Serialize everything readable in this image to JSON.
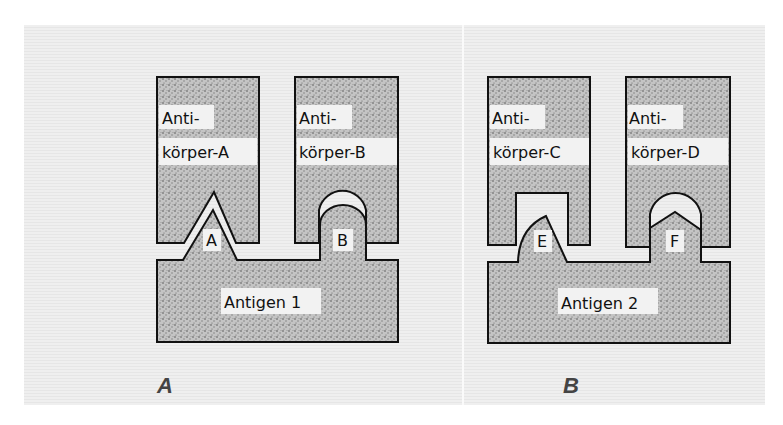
{
  "colors": {
    "page": "#ffffff",
    "panel_bg": "#efefef",
    "stipple_fill": "#bdbdbd",
    "outline": "#111111",
    "label_chip": "#f2f2f2",
    "panel_letter": "#444444"
  },
  "panels": [
    {
      "letter": "A",
      "antibodies": [
        {
          "line1": "Anti-",
          "line2": "körper-A",
          "binding_site": "triangular-notch"
        },
        {
          "line1": "Anti-",
          "line2": "körper-B",
          "binding_site": "rounded-dome"
        }
      ],
      "antigen": {
        "label": "Antigen 1",
        "epitopes": [
          {
            "label": "A",
            "shape": "triangle"
          },
          {
            "label": "B",
            "shape": "rounded-dome"
          }
        ]
      }
    },
    {
      "letter": "B",
      "antibodies": [
        {
          "line1": "Anti-",
          "line2": "körper-C",
          "binding_site": "rectangular-notch"
        },
        {
          "line1": "Anti-",
          "line2": "körper-D",
          "binding_site": "rounded-dome"
        }
      ],
      "antigen": {
        "label": "Antigen 2",
        "epitopes": [
          {
            "label": "E",
            "shape": "irregular-bump"
          },
          {
            "label": "F",
            "shape": "pointed-roof"
          }
        ]
      }
    }
  ]
}
